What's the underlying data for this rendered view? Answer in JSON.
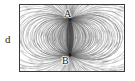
{
  "figure": {
    "caption_label": "d",
    "frame": {
      "x": 19,
      "y": 4,
      "width": 106,
      "height": 68,
      "border_color": "#3a3a3a"
    },
    "background_color": "#ffffff",
    "line_color": "#4a4a4a",
    "poles": [
      {
        "id": "A",
        "label": "A",
        "x": 70,
        "y": 19,
        "label_x": 64,
        "label_y": 9,
        "polarity": "source"
      },
      {
        "id": "B",
        "label": "B",
        "x": 70,
        "y": 55,
        "label_x": 62,
        "label_y": 56,
        "polarity": "sink"
      }
    ]
  },
  "chart_data": {
    "type": "scatter",
    "title": "",
    "xlabel": "",
    "ylabel": "",
    "legend": [],
    "annotations": [
      "A",
      "B",
      "d"
    ],
    "points": [
      {
        "name": "A",
        "x": 70,
        "y": 19
      },
      {
        "name": "B",
        "x": 70,
        "y": 55
      }
    ]
  }
}
